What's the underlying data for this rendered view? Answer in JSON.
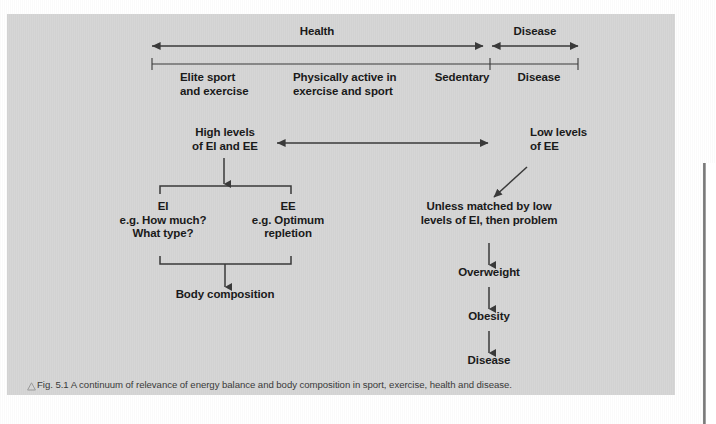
{
  "figure": {
    "panel_color": "#d6d6d6",
    "ink_color": "#3a3a3a",
    "text_color": "#1a1a1a",
    "caption_marker": "triangle-outline-icon",
    "caption": "Fig. 5.1 A continuum of relevance of energy balance and body composition in sport, exercise, health and disease."
  },
  "continuum": {
    "health_label": "Health",
    "disease_label": "Disease",
    "segments": [
      {
        "label": "Elite sport\nand exercise"
      },
      {
        "label": "Physically active in\nexercise and sport"
      },
      {
        "label": "Sedentary"
      },
      {
        "label": "Disease"
      }
    ]
  },
  "flow": {
    "high_levels": "High levels\nof EI and EE",
    "low_levels": "Low levels\nof EE",
    "ei": "EI\ne.g. How much?\nWhat type?",
    "ee": "EE\ne.g. Optimum\nrepletion",
    "body_composition": "Body composition",
    "unless_matched": "Unless matched by low\nlevels of EI, then problem",
    "overweight": "Overweight",
    "obesity": "Obesity",
    "disease": "Disease"
  }
}
